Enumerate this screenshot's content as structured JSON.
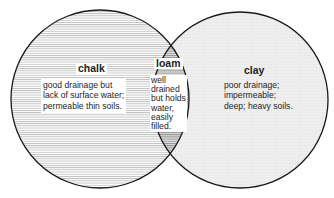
{
  "diagram": {
    "type": "venn",
    "colors": {
      "outline": "#1a1a1a",
      "chalk_hatch": "#b8b8b8",
      "clay_fill": "#ececec",
      "loam_hatch": "#8a8a8a",
      "text": "#1e1e1e"
    },
    "sets": [
      {
        "id": "chalk",
        "title": "chalk",
        "description_lines": [
          "good drainage but",
          "lack of surface water;",
          "permeable thin soils."
        ]
      },
      {
        "id": "clay",
        "title": "clay",
        "description_lines": [
          "poor drainage;",
          "impermeable;",
          "deep; heavy soils."
        ]
      }
    ],
    "intersection": {
      "id": "loam",
      "title": "loam",
      "description_lines": [
        "well",
        "drained",
        "but holds",
        "water,",
        "easily",
        "filled."
      ]
    }
  }
}
